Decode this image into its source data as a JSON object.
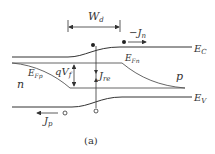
{
  "diagram": {
    "caption": "(a)",
    "labels": {
      "depletion_width": "W",
      "depletion_width_sub": "d",
      "electron_current": "−J",
      "electron_current_sub": "n",
      "conduction_band": "E",
      "conduction_band_sub": "C",
      "valence_band": "E",
      "valence_band_sub": "V",
      "quasi_fermi_n": "E",
      "quasi_fermi_n_sub": "Fn",
      "quasi_fermi_p": "E",
      "quasi_fermi_p_sub": "Fp",
      "forward_voltage": "qV",
      "forward_voltage_sub": "f",
      "recombination_current": "J",
      "recombination_current_sub": "re",
      "hole_current": "J",
      "hole_current_sub": "p",
      "n_region": "n",
      "p_region": "p"
    },
    "colors": {
      "line": "#333333",
      "background": "#ffffff"
    }
  }
}
